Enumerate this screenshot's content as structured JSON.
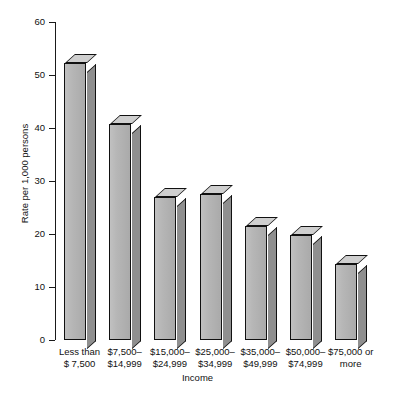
{
  "chart_data": {
    "type": "bar",
    "title": "",
    "subtitle": "",
    "xlabel": "Income",
    "ylabel": "Rate per 1,000 persons",
    "ylim": [
      0,
      60
    ],
    "yticks": [
      0,
      10,
      20,
      30,
      40,
      50,
      60
    ],
    "ytick_labels": [
      "0",
      "10",
      "20",
      "30",
      "40",
      "50",
      "60"
    ],
    "grid": false,
    "legend": null,
    "style": "3d-bars",
    "categories": [
      "Less than $ 7,500",
      "$7,500–$14,999",
      "$15,000–$24,999",
      "$25,000–$34,999",
      "$35,000–$49,999",
      "$50,000–$74,999",
      "$75,000 or more"
    ],
    "category_lines": [
      [
        "Less than",
        "$ 7,500"
      ],
      [
        "$7,500–",
        "$14,999"
      ],
      [
        "$15,000–",
        "$24,999"
      ],
      [
        "$25,000–",
        "$34,999"
      ],
      [
        "$35,000–",
        "$49,999"
      ],
      [
        "$50,000–",
        "$74,999"
      ],
      [
        "$75,000 or",
        "more"
      ]
    ],
    "values": [
      52.3,
      40.8,
      27.0,
      27.5,
      21.5,
      19.8,
      14.4
    ],
    "colors": {
      "bar_front": "#b3b3b3",
      "bar_side": "#8f8f8f",
      "bar_top": "#cfcfcf",
      "outline": "#111111",
      "axis": "#1a1a1a",
      "text": "#111111",
      "background": "#ffffff"
    }
  }
}
